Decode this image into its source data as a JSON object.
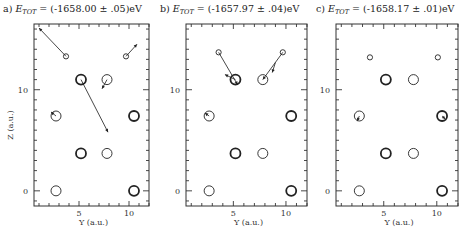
{
  "figure": {
    "ylabel": "Z (a.u.)",
    "xlabel": "Y (a.u.)"
  },
  "chart_data": [
    {
      "type": "scatter",
      "panel": "a",
      "title": "a) E_TOT = (-1658.00 ± .05)eV",
      "title_parts": {
        "prefix": "a) ",
        "sym": "E",
        "sub": "TOT",
        "rest": " = (-1658.00 ± .05)eV"
      },
      "xlabel": "Y (a.u.)",
      "ylabel": "Z (a.u.)",
      "xlim": [
        0.5,
        12
      ],
      "ylim": [
        -1.5,
        16.5
      ],
      "xticks": [
        5,
        10
      ],
      "yticks": [
        0,
        10
      ],
      "grid": false,
      "atoms": [
        {
          "y": 2.7,
          "z": 0,
          "size": "medium",
          "weight": "light"
        },
        {
          "y": 10.5,
          "z": 0,
          "size": "medium",
          "weight": "bold"
        },
        {
          "y": 5.2,
          "z": 3.7,
          "size": "medium",
          "weight": "bold"
        },
        {
          "y": 7.8,
          "z": 3.7,
          "size": "medium",
          "weight": "light"
        },
        {
          "y": 2.7,
          "z": 7.4,
          "size": "medium",
          "weight": "light"
        },
        {
          "y": 10.5,
          "z": 7.4,
          "size": "medium",
          "weight": "bold"
        },
        {
          "y": 5.2,
          "z": 11.0,
          "size": "medium",
          "weight": "bold"
        },
        {
          "y": 7.8,
          "z": 11.0,
          "size": "medium",
          "weight": "light"
        },
        {
          "y": 3.7,
          "z": 13.3,
          "size": "small",
          "weight": "light"
        },
        {
          "y": 9.7,
          "z": 13.3,
          "size": "small",
          "weight": "light"
        }
      ],
      "displacements": [
        {
          "from": [
            3.7,
            13.3
          ],
          "to": [
            1.0,
            16.1
          ]
        },
        {
          "from": [
            9.7,
            13.3
          ],
          "to": [
            10.8,
            14.5
          ]
        },
        {
          "from": [
            5.2,
            11.0
          ],
          "to": [
            7.9,
            5.8
          ]
        },
        {
          "from": [
            7.8,
            11.0
          ],
          "to": [
            7.3,
            10.1
          ]
        },
        {
          "from": [
            2.7,
            7.4
          ],
          "to": [
            2.2,
            7.8
          ]
        }
      ]
    },
    {
      "type": "scatter",
      "panel": "b",
      "title": "b) E_TOT = (-1657.97 ± .04)eV",
      "title_parts": {
        "prefix": "b) ",
        "sym": "E",
        "sub": "TOT",
        "rest": " = (-1657.97 ± .04)eV"
      },
      "xlabel": "Y (a.u.)",
      "ylabel": "",
      "xlim": [
        0.5,
        12
      ],
      "ylim": [
        -1.5,
        16.5
      ],
      "xticks": [
        5,
        10
      ],
      "yticks": [
        0,
        10
      ],
      "grid": false,
      "atoms": [
        {
          "y": 2.7,
          "z": 0,
          "size": "medium",
          "weight": "light"
        },
        {
          "y": 10.5,
          "z": 0,
          "size": "medium",
          "weight": "bold"
        },
        {
          "y": 5.2,
          "z": 3.7,
          "size": "medium",
          "weight": "bold"
        },
        {
          "y": 7.8,
          "z": 3.7,
          "size": "medium",
          "weight": "light"
        },
        {
          "y": 2.7,
          "z": 7.4,
          "size": "medium",
          "weight": "light"
        },
        {
          "y": 10.5,
          "z": 7.4,
          "size": "medium",
          "weight": "bold"
        },
        {
          "y": 5.2,
          "z": 11.0,
          "size": "medium",
          "weight": "bold"
        },
        {
          "y": 7.8,
          "z": 11.0,
          "size": "medium",
          "weight": "light"
        },
        {
          "y": 3.6,
          "z": 13.7,
          "size": "small",
          "weight": "light"
        },
        {
          "y": 9.7,
          "z": 13.7,
          "size": "small",
          "weight": "light"
        }
      ],
      "displacements": [
        {
          "from": [
            3.6,
            13.7
          ],
          "to": [
            5.4,
            10.5
          ]
        },
        {
          "from": [
            5.2,
            11.0
          ],
          "to": [
            4.2,
            11.5
          ]
        },
        {
          "from": [
            9.7,
            13.7
          ],
          "to": [
            7.8,
            11.0
          ]
        },
        {
          "from": [
            9.0,
            12.7
          ],
          "to": [
            8.7,
            11.7
          ]
        },
        {
          "from": [
            2.7,
            7.4
          ],
          "to": [
            2.3,
            7.7
          ]
        }
      ]
    },
    {
      "type": "scatter",
      "panel": "c",
      "title": "c) E_TOT = (-1658.17 ± .01)eV",
      "title_parts": {
        "prefix": "c) ",
        "sym": "E",
        "sub": "TOT",
        "rest": " = (-1658.17 ± .01)eV"
      },
      "xlabel": "Y (a.u.)",
      "ylabel": "",
      "xlim": [
        0.5,
        12
      ],
      "ylim": [
        -1.5,
        16.5
      ],
      "xticks": [
        5,
        10
      ],
      "yticks": [
        0,
        10
      ],
      "grid": false,
      "atoms": [
        {
          "y": 2.7,
          "z": 0,
          "size": "medium",
          "weight": "light"
        },
        {
          "y": 10.5,
          "z": 0,
          "size": "medium",
          "weight": "bold"
        },
        {
          "y": 5.2,
          "z": 3.7,
          "size": "medium",
          "weight": "bold"
        },
        {
          "y": 7.8,
          "z": 3.7,
          "size": "medium",
          "weight": "light"
        },
        {
          "y": 2.7,
          "z": 7.4,
          "size": "medium",
          "weight": "light"
        },
        {
          "y": 10.5,
          "z": 7.4,
          "size": "medium",
          "weight": "bold"
        },
        {
          "y": 5.2,
          "z": 11.0,
          "size": "medium",
          "weight": "bold"
        },
        {
          "y": 7.8,
          "z": 11.0,
          "size": "medium",
          "weight": "light"
        },
        {
          "y": 3.7,
          "z": 13.2,
          "size": "small",
          "weight": "light"
        },
        {
          "y": 10.1,
          "z": 13.2,
          "size": "small",
          "weight": "light"
        }
      ],
      "displacements": [
        {
          "from": [
            2.7,
            7.4
          ],
          "to": [
            2.5,
            6.9
          ]
        },
        {
          "from": [
            10.5,
            7.4
          ],
          "to": [
            10.8,
            7.1
          ]
        }
      ]
    }
  ]
}
